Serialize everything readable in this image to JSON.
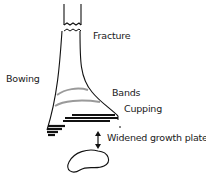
{
  "diagram": {
    "labels": {
      "fracture": "Fracture",
      "bowing": "Bowing",
      "bands": "Bands",
      "cupping": "Cupping",
      "widened_growth_plate": "Widened growth plate"
    },
    "colors": {
      "outline": "#111111",
      "bands": "#9a9a9a",
      "dark_bands": "#111111",
      "background": "#ffffff"
    }
  }
}
